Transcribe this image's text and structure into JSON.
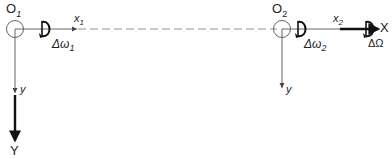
{
  "diagram": {
    "origin1": {
      "label": "O",
      "sub": "1"
    },
    "origin2": {
      "label": "O",
      "sub": "2"
    },
    "axis_x1": {
      "label": "x",
      "sub": "1"
    },
    "axis_x2": {
      "label": "x",
      "sub": "2"
    },
    "axis_y1": {
      "label": "y"
    },
    "axis_y2": {
      "label": "y"
    },
    "axis_X": {
      "label": "X"
    },
    "axis_Y": {
      "label": "Y"
    },
    "rot1": {
      "label": "Δω",
      "sub": "1"
    },
    "rot2": {
      "label": "Δω",
      "sub": "2"
    },
    "rotOmega": {
      "label": "ΔΩ"
    },
    "colors": {
      "line": "#333333",
      "dash": "#888888"
    }
  }
}
